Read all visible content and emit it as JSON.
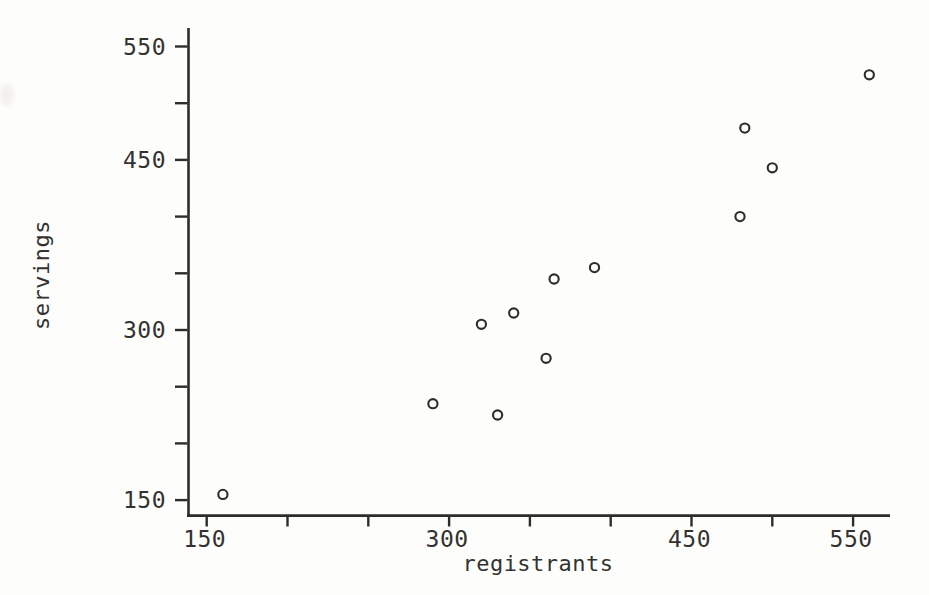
{
  "figure": {
    "background": "#fdfdfc",
    "ink_color": "#2e2d2c",
    "label_color": "#333231",
    "marker_fill": "#fdfdfc"
  },
  "chart_data": {
    "type": "scatter",
    "title": "",
    "xlabel": "registrants",
    "ylabel": "servings",
    "xlim": [
      138,
      573
    ],
    "ylim": [
      128,
      568
    ],
    "x_ticks": [
      150,
      200,
      250,
      300,
      350,
      400,
      450,
      500,
      550
    ],
    "x_tick_labels": [
      "150",
      "300",
      "450",
      "550"
    ],
    "x_labeled_values": [
      150,
      300,
      450,
      550
    ],
    "y_ticks": [
      150,
      200,
      250,
      300,
      350,
      400,
      450,
      500,
      550
    ],
    "y_tick_labels": [
      "150",
      "300",
      "450",
      "550"
    ],
    "y_labeled_values": [
      150,
      300,
      450,
      550
    ],
    "grid": false,
    "legend": null,
    "marker": "open-circle",
    "points": [
      {
        "x": 160,
        "y": 155
      },
      {
        "x": 290,
        "y": 235
      },
      {
        "x": 330,
        "y": 225
      },
      {
        "x": 320,
        "y": 305
      },
      {
        "x": 340,
        "y": 315
      },
      {
        "x": 360,
        "y": 275
      },
      {
        "x": 365,
        "y": 345
      },
      {
        "x": 390,
        "y": 355
      },
      {
        "x": 480,
        "y": 400
      },
      {
        "x": 483,
        "y": 478
      },
      {
        "x": 500,
        "y": 443
      },
      {
        "x": 560,
        "y": 525
      }
    ]
  }
}
